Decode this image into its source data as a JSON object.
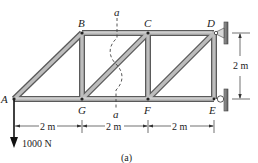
{
  "diagram": {
    "type": "truss",
    "caption": "(a)",
    "joints": {
      "A": {
        "label": "A"
      },
      "B": {
        "label": "B"
      },
      "C": {
        "label": "C"
      },
      "D": {
        "label": "D"
      },
      "E": {
        "label": "E"
      },
      "F": {
        "label": "F"
      },
      "G": {
        "label": "G"
      }
    },
    "members": [
      "AB",
      "BC",
      "CD",
      "AG",
      "GF",
      "FE",
      "BG",
      "CF",
      "DE",
      "GC",
      "FD"
    ],
    "section": {
      "label_top": "a",
      "label_bottom": "a"
    },
    "dimensions": {
      "bottom": [
        "2 m",
        "2 m",
        "2 m"
      ],
      "right": "2 m"
    },
    "load": {
      "label": "1000 N",
      "joint": "A",
      "direction": "down"
    },
    "supports": {
      "D": "pin",
      "E": "roller"
    },
    "colors": {
      "member_fill": "#b8b8b8",
      "member_edge": "#5a5a5a",
      "line": "#222222",
      "wall": "#7a7a7a"
    }
  }
}
